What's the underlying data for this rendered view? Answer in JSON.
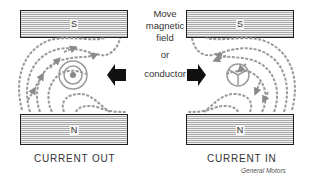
{
  "diagram": {
    "left": {
      "top_magnet": {
        "pole": "S"
      },
      "bottom_magnet": {
        "pole": "N"
      },
      "conductor_symbol": "dot (current out of page)",
      "caption": "CURRENT OUT"
    },
    "right": {
      "top_magnet": {
        "pole": "S"
      },
      "bottom_magnet": {
        "pole": "N"
      },
      "conductor_symbol": "cross (current into page)",
      "caption": "CURRENT IN"
    },
    "center_text": {
      "line1": "Move",
      "line2": "magnetic",
      "line3": "field",
      "line4": "or",
      "line5": "conductor"
    },
    "arrows": {
      "left_arrow": "points left toward left conductor",
      "right_arrow": "points right toward right conductor"
    },
    "credit": "General Motors",
    "colors": {
      "magnet_border": "#1e1e1e",
      "field_lines": "#999999",
      "arrow_fill": "#111111"
    }
  }
}
